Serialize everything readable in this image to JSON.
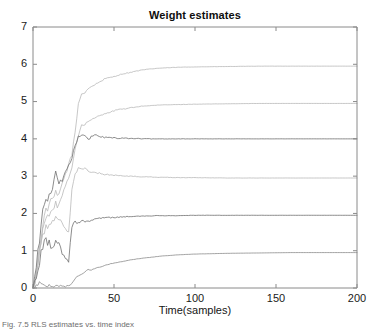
{
  "figure": {
    "title": "Weight estimates",
    "caption": "Fig. 7.5   RLS estimates vs. time index"
  },
  "chart_data": {
    "type": "line",
    "title": "Weight estimates",
    "xlabel": "Time(samples)",
    "ylabel": "",
    "xlim": [
      0,
      200
    ],
    "ylim": [
      0,
      7
    ],
    "xticks": [
      0,
      50,
      100,
      150,
      200
    ],
    "yticks": [
      0,
      1,
      2,
      3,
      4,
      5,
      6,
      7
    ],
    "grid": false,
    "legend": "none",
    "background": "#ffffff",
    "axis_color": "#8a8a8a",
    "series": [
      {
        "name": "w1",
        "color": "#b9b9b9",
        "final_value": 5.95,
        "x": [
          0,
          2,
          4,
          6,
          8,
          10,
          12,
          14,
          16,
          18,
          20,
          22,
          24,
          26,
          28,
          30,
          32,
          34,
          36,
          38,
          40,
          44,
          48,
          52,
          56,
          60,
          64,
          68,
          72,
          76,
          80,
          90,
          100,
          120,
          140,
          160,
          180,
          200
        ],
        "values": [
          0,
          0.45,
          1.05,
          1.75,
          2.05,
          2.25,
          2.35,
          2.55,
          2.45,
          2.8,
          3.05,
          3.3,
          3.6,
          4.15,
          4.95,
          5.2,
          5.25,
          5.35,
          5.4,
          5.45,
          5.5,
          5.6,
          5.65,
          5.7,
          5.75,
          5.78,
          5.82,
          5.85,
          5.87,
          5.89,
          5.9,
          5.92,
          5.93,
          5.94,
          5.95,
          5.95,
          5.95,
          5.95
        ]
      },
      {
        "name": "w2",
        "color": "#b9b9b9",
        "final_value": 4.95,
        "x": [
          0,
          2,
          4,
          6,
          8,
          10,
          12,
          14,
          16,
          18,
          20,
          22,
          24,
          26,
          28,
          30,
          32,
          34,
          36,
          38,
          40,
          44,
          48,
          52,
          56,
          60,
          64,
          68,
          72,
          76,
          80,
          90,
          100,
          120,
          140,
          160,
          180,
          200
        ],
        "values": [
          0,
          0.4,
          0.95,
          1.55,
          1.85,
          2.0,
          2.1,
          2.25,
          2.2,
          2.45,
          2.7,
          2.95,
          3.25,
          3.75,
          4.1,
          4.35,
          4.4,
          4.45,
          4.5,
          4.55,
          4.6,
          4.68,
          4.72,
          4.78,
          4.8,
          4.83,
          4.86,
          4.88,
          4.89,
          4.9,
          4.91,
          4.92,
          4.93,
          4.94,
          4.95,
          4.95,
          4.95,
          4.95
        ]
      },
      {
        "name": "w3",
        "color": "#6f6f6f",
        "final_value": 4.0,
        "x": [
          0,
          2,
          4,
          6,
          8,
          10,
          12,
          14,
          16,
          18,
          20,
          22,
          24,
          26,
          28,
          30,
          32,
          34,
          36,
          38,
          40,
          44,
          48,
          52,
          56,
          60,
          64,
          68,
          72,
          76,
          80,
          90,
          100,
          120,
          140,
          160,
          180,
          200
        ],
        "values": [
          0,
          0.55,
          1.3,
          2.0,
          2.35,
          2.5,
          2.6,
          3.2,
          2.85,
          2.9,
          3.1,
          3.3,
          3.5,
          3.8,
          4.05,
          4.1,
          4.08,
          3.98,
          4.05,
          4.1,
          4.08,
          4.04,
          4.03,
          4.02,
          4.02,
          4.01,
          4.01,
          4.0,
          4.0,
          4.0,
          4.0,
          4.0,
          4.0,
          4.0,
          4.0,
          4.0,
          4.0,
          4.0
        ]
      },
      {
        "name": "w4",
        "color": "#b9b9b9",
        "final_value": 2.95,
        "x": [
          0,
          2,
          4,
          6,
          8,
          10,
          12,
          14,
          16,
          18,
          20,
          22,
          24,
          26,
          28,
          30,
          32,
          34,
          36,
          38,
          40,
          44,
          48,
          52,
          56,
          60,
          64,
          68,
          72,
          76,
          80,
          90,
          100,
          120,
          140,
          160,
          180,
          200
        ],
        "values": [
          0,
          0.35,
          0.85,
          1.4,
          1.6,
          1.75,
          1.8,
          1.95,
          1.85,
          1.7,
          1.55,
          1.5,
          2.6,
          3.1,
          3.2,
          3.22,
          3.2,
          3.15,
          3.12,
          3.1,
          3.08,
          3.05,
          3.03,
          3.02,
          3.0,
          3.0,
          2.99,
          2.98,
          2.98,
          2.97,
          2.97,
          2.96,
          2.96,
          2.95,
          2.95,
          2.95,
          2.95,
          2.95
        ]
      },
      {
        "name": "w5",
        "color": "#6f6f6f",
        "final_value": 1.95,
        "x": [
          0,
          2,
          4,
          6,
          8,
          10,
          12,
          14,
          16,
          18,
          20,
          22,
          24,
          26,
          28,
          30,
          32,
          34,
          36,
          38,
          40,
          44,
          48,
          52,
          56,
          60,
          64,
          68,
          72,
          76,
          80,
          90,
          100,
          120,
          140,
          160,
          180,
          200
        ],
        "values": [
          0,
          0.3,
          0.7,
          1.15,
          1.25,
          1.2,
          1.1,
          1.3,
          1.15,
          0.95,
          0.85,
          0.72,
          1.65,
          1.78,
          1.75,
          1.8,
          1.78,
          1.8,
          1.82,
          1.85,
          1.86,
          1.88,
          1.89,
          1.9,
          1.91,
          1.92,
          1.92,
          1.93,
          1.93,
          1.94,
          1.94,
          1.94,
          1.95,
          1.95,
          1.95,
          1.95,
          1.95,
          1.95
        ]
      },
      {
        "name": "w6",
        "color": "#8c8c8c",
        "final_value": 0.95,
        "x": [
          0,
          2,
          4,
          6,
          8,
          10,
          12,
          14,
          16,
          18,
          20,
          22,
          24,
          26,
          28,
          30,
          32,
          34,
          36,
          38,
          40,
          44,
          48,
          52,
          56,
          60,
          64,
          68,
          72,
          76,
          80,
          90,
          100,
          120,
          140,
          160,
          180,
          200
        ],
        "values": [
          0,
          0.1,
          0.12,
          0.1,
          0.08,
          0.06,
          0.05,
          0.05,
          0.05,
          0.05,
          0.05,
          0.05,
          0.12,
          0.25,
          0.33,
          0.38,
          0.42,
          0.5,
          0.48,
          0.52,
          0.55,
          0.6,
          0.65,
          0.68,
          0.72,
          0.75,
          0.78,
          0.8,
          0.82,
          0.84,
          0.86,
          0.89,
          0.91,
          0.93,
          0.94,
          0.95,
          0.95,
          0.95
        ]
      }
    ]
  }
}
